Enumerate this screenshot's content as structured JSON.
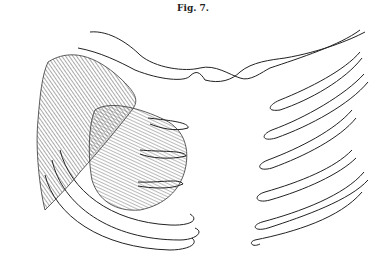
{
  "figure": {
    "caption": "Fig. 7.",
    "line_color": "#222222",
    "hatch_color": "#555555",
    "background": "#ffffff"
  }
}
